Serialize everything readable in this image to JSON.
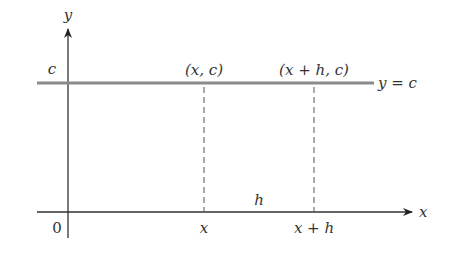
{
  "diagram": {
    "axes": {
      "x_label": "x",
      "y_label": "y",
      "origin_label": "0"
    },
    "line": {
      "label": "y = c",
      "y_intercept_label": "c"
    },
    "points": [
      {
        "label": "(x, c)",
        "x_tick": "x"
      },
      {
        "label": "(x + h, c)",
        "x_tick": "x + h"
      }
    ],
    "interval_label": "h",
    "colors": {
      "axis": "#333333",
      "line": "#888888",
      "dashed": "#555555",
      "text": "#333333"
    }
  }
}
